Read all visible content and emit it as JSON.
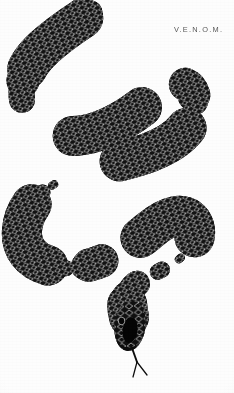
{
  "canvas": {
    "width": 234,
    "height": 393,
    "background": "#fdfdfd"
  },
  "wordmark": {
    "text": "V.E.N.O.M.",
    "color": "#4a4a4a",
    "x": 174,
    "y": 25
  },
  "artwork": {
    "subject": "snake",
    "title": "V.E.N.O.M.",
    "style": "black-and-white illustration",
    "body_color": "#111111",
    "scale_outline_color": "#d8d8d8",
    "scale_shape": "diamond-lattice",
    "orientation": "vertical serpentine S-curves",
    "tail_tip": {
      "x": 95,
      "y": 8
    },
    "head": {
      "x": 130,
      "y": 322,
      "direction": "downward"
    },
    "tongue": {
      "forked": true,
      "tip_y": 377,
      "color": "#0d0d0d"
    },
    "path_points": [
      {
        "x": 95,
        "y": 10,
        "w": 4
      },
      {
        "x": 74,
        "y": 30,
        "w": 9
      },
      {
        "x": 44,
        "y": 52,
        "w": 14
      },
      {
        "x": 25,
        "y": 82,
        "w": 17
      },
      {
        "x": 31,
        "y": 112,
        "w": 19
      },
      {
        "x": 58,
        "y": 128,
        "w": 20
      },
      {
        "x": 96,
        "y": 124,
        "w": 21
      },
      {
        "x": 138,
        "y": 100,
        "w": 22
      },
      {
        "x": 170,
        "y": 80,
        "w": 23
      },
      {
        "x": 187,
        "y": 100,
        "w": 23
      },
      {
        "x": 180,
        "y": 132,
        "w": 23
      },
      {
        "x": 148,
        "y": 152,
        "w": 23
      },
      {
        "x": 104,
        "y": 162,
        "w": 23
      },
      {
        "x": 66,
        "y": 176,
        "w": 23
      },
      {
        "x": 36,
        "y": 200,
        "w": 22
      },
      {
        "x": 27,
        "y": 232,
        "w": 22
      },
      {
        "x": 44,
        "y": 256,
        "w": 22
      },
      {
        "x": 82,
        "y": 258,
        "w": 22
      },
      {
        "x": 126,
        "y": 240,
        "w": 22
      },
      {
        "x": 166,
        "y": 216,
        "w": 21
      },
      {
        "x": 190,
        "y": 228,
        "w": 20
      },
      {
        "x": 186,
        "y": 252,
        "w": 18
      },
      {
        "x": 160,
        "y": 268,
        "w": 16
      },
      {
        "x": 136,
        "y": 276,
        "w": 14
      },
      {
        "x": 124,
        "y": 292,
        "w": 13
      },
      {
        "x": 126,
        "y": 310,
        "w": 12
      }
    ]
  }
}
